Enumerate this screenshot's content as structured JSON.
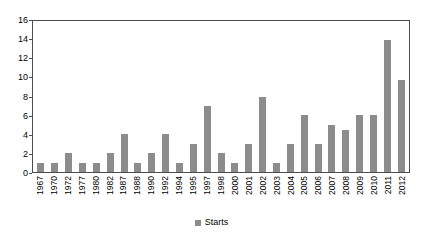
{
  "chart_data": {
    "type": "bar",
    "title": "",
    "subtitle": "",
    "xlabel": "",
    "ylabel": "",
    "ylim": [
      0,
      16
    ],
    "ytick_step": 2,
    "yticks": [
      0,
      2,
      4,
      6,
      8,
      10,
      12,
      14,
      16
    ],
    "grid": false,
    "legend_position": "bottom",
    "legend": [
      "Starts"
    ],
    "series_name": "Starts",
    "bar_color": "#8c8c8c",
    "axis_color": "#4d4d4d",
    "background_color": "#ffffff",
    "text_color": "#000000",
    "xtick_rotation": -90,
    "categories": [
      "1967",
      "1970",
      "1972",
      "1977",
      "1980",
      "1982",
      "1987",
      "1988",
      "1990",
      "1992",
      "1994",
      "1995",
      "1997",
      "1998",
      "2000",
      "2001",
      "2002",
      "2003",
      "2004",
      "2005",
      "2006",
      "2007",
      "2008",
      "2009",
      "2010",
      "2011",
      "2012"
    ],
    "values": [
      1,
      1,
      2,
      1,
      1,
      2,
      4,
      1,
      2,
      4,
      1,
      3,
      7,
      2,
      1,
      3,
      8,
      1,
      3,
      6,
      3,
      5,
      4.5,
      6,
      6,
      14,
      9.7
    ],
    "series": [
      {
        "name": "Starts",
        "values": [
          1,
          1,
          2,
          1,
          1,
          2,
          4,
          1,
          2,
          4,
          1,
          3,
          7,
          2,
          1,
          3,
          8,
          1,
          3,
          6,
          3,
          5,
          4.5,
          6,
          6,
          14,
          9.7
        ]
      }
    ]
  }
}
